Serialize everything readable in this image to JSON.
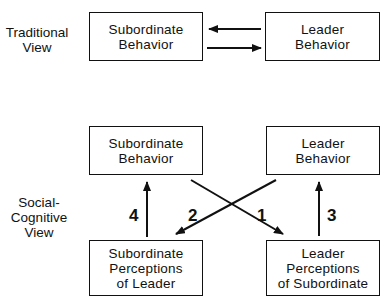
{
  "traditional": {
    "label": [
      "Traditional",
      "View"
    ],
    "subordinate_behavior": [
      "Subordinate",
      "Behavior"
    ],
    "leader_behavior": [
      "Leader",
      "Behavior"
    ]
  },
  "social_cognitive": {
    "label": [
      "Social-",
      "Cognitive",
      "View"
    ],
    "subordinate_behavior": [
      "Subordinate",
      "Behavior"
    ],
    "leader_behavior": [
      "Leader",
      "Behavior"
    ],
    "subordinate_perceptions": [
      "Subordinate",
      "Perceptions",
      "of Leader"
    ],
    "leader_perceptions": [
      "Leader",
      "Perceptions",
      "of Subordinate"
    ],
    "arrow_labels": {
      "a1": "1",
      "a2": "2",
      "a3": "3",
      "a4": "4"
    }
  }
}
